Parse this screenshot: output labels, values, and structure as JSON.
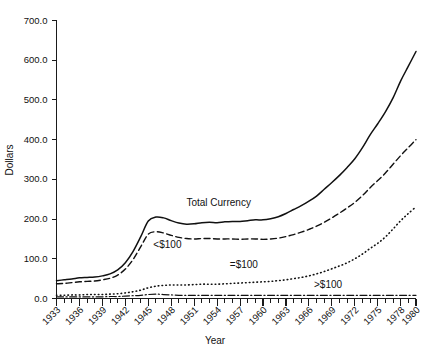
{
  "chart_data": {
    "type": "line",
    "title": "",
    "xlabel": "Year",
    "ylabel": "Dollars",
    "xlim": [
      1933,
      1980
    ],
    "ylim": [
      0,
      700
    ],
    "ytick_labels": [
      "0.0",
      "100.0",
      "200.0",
      "300.0",
      "400.0",
      "500.0",
      "600.0",
      "700.0"
    ],
    "ytick_values": [
      0,
      100,
      200,
      300,
      400,
      500,
      600,
      700
    ],
    "xtick_labels": [
      "1933",
      "1936",
      "1939",
      "1942",
      "1945",
      "1948",
      "1951",
      "1954",
      "1957",
      "1960",
      "1963",
      "1966",
      "1969",
      "1972",
      "1975",
      "1978",
      "1980"
    ],
    "xtick_values": [
      1933,
      1936,
      1939,
      1942,
      1945,
      1948,
      1951,
      1954,
      1957,
      1960,
      1963,
      1966,
      1969,
      1972,
      1975,
      1978,
      1980
    ],
    "grid": false,
    "legend_position": "inline-annotations",
    "x": [
      1933,
      1934,
      1935,
      1936,
      1937,
      1938,
      1939,
      1940,
      1941,
      1942,
      1943,
      1944,
      1945,
      1946,
      1947,
      1948,
      1949,
      1950,
      1951,
      1952,
      1953,
      1954,
      1955,
      1956,
      1957,
      1958,
      1959,
      1960,
      1961,
      1962,
      1963,
      1964,
      1965,
      1966,
      1967,
      1968,
      1969,
      1970,
      1971,
      1972,
      1973,
      1974,
      1975,
      1976,
      1977,
      1978,
      1979,
      1980
    ],
    "series": [
      {
        "name": "Total Currency",
        "style": "solid",
        "annotation": "Total Currency",
        "annotation_x": 1954.2,
        "annotation_y": 232,
        "values": [
          45,
          47,
          49,
          52,
          53,
          54,
          57,
          62,
          72,
          90,
          118,
          155,
          195,
          205,
          203,
          196,
          190,
          187,
          188,
          191,
          192,
          191,
          193,
          194,
          194,
          196,
          198,
          198,
          201,
          206,
          214,
          224,
          234,
          245,
          258,
          275,
          292,
          310,
          330,
          352,
          380,
          412,
          440,
          470,
          505,
          548,
          585,
          622
        ]
      },
      {
        "name": "<$100",
        "style": "dashed",
        "annotation": "<$100",
        "annotation_x": 1947.5,
        "annotation_y": 126,
        "values": [
          37,
          38,
          40,
          42,
          43,
          44,
          47,
          51,
          59,
          74,
          98,
          130,
          162,
          168,
          165,
          159,
          154,
          151,
          150,
          151,
          151,
          150,
          150,
          150,
          149,
          150,
          150,
          149,
          150,
          152,
          156,
          161,
          167,
          174,
          182,
          192,
          203,
          215,
          228,
          242,
          259,
          279,
          297,
          316,
          338,
          360,
          380,
          400
        ]
      },
      {
        "name": "=$100",
        "style": "dotted",
        "annotation": "=$100",
        "annotation_x": 1957.5,
        "annotation_y": 76,
        "values": [
          8,
          8,
          9,
          9,
          10,
          10,
          10,
          11,
          12,
          14,
          17,
          21,
          27,
          31,
          33,
          34,
          34,
          34,
          35,
          36,
          36,
          36,
          37,
          38,
          39,
          40,
          41,
          42,
          43,
          45,
          47,
          50,
          53,
          57,
          62,
          68,
          75,
          82,
          90,
          100,
          112,
          126,
          139,
          155,
          175,
          196,
          214,
          231
        ]
      },
      {
        "name": ">$100",
        "style": "dash-dot",
        "annotation": ">$100",
        "annotation_x": 1968.5,
        "annotation_y": 26,
        "values": [
          4,
          4,
          4,
          4,
          4,
          4,
          4,
          5,
          5,
          6,
          7,
          8,
          10,
          11,
          10,
          9,
          8,
          8,
          8,
          8,
          8,
          8,
          8,
          8,
          8,
          8,
          8,
          8,
          8,
          8,
          8,
          8,
          8,
          8,
          8,
          8,
          8,
          8,
          8,
          8,
          8,
          8,
          8,
          8,
          8,
          8,
          8,
          8
        ]
      }
    ]
  },
  "axes": {
    "y_title": "Dollars",
    "x_title": "Year"
  },
  "colors": {
    "ink": "#111111",
    "background": "#ffffff"
  }
}
